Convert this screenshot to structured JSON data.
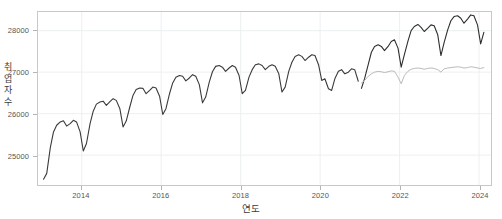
{
  "chart_data": {
    "type": "line",
    "title": "",
    "xlabel": "연도",
    "ylabel": "취업자수",
    "ylabel_chars": [
      "취",
      "업",
      "자",
      "수"
    ],
    "xlim": [
      2012.9,
      2024.3
    ],
    "ylim": [
      24280,
      28450
    ],
    "yticks": [
      25000,
      26000,
      27000,
      28000
    ],
    "ytick_labels": [
      "25000",
      "26000",
      "27000",
      "28000"
    ],
    "xticks": [
      2014,
      2016,
      2018,
      2020,
      2022,
      2024
    ],
    "xtick_labels": [
      "2014",
      "2016",
      "2018",
      "2020",
      "2022",
      "2024"
    ],
    "grid": true,
    "legend": "none",
    "series": [
      {
        "name": "취업자수-관측",
        "color": "#3a3a3a",
        "width": 1.1,
        "x": [
          2013.04,
          2013.12,
          2013.21,
          2013.29,
          2013.37,
          2013.46,
          2013.54,
          2013.62,
          2013.71,
          2013.79,
          2013.87,
          2013.96,
          2014.04,
          2014.12,
          2014.21,
          2014.29,
          2014.37,
          2014.46,
          2014.54,
          2014.62,
          2014.71,
          2014.79,
          2014.87,
          2014.96,
          2015.04,
          2015.12,
          2015.21,
          2015.29,
          2015.37,
          2015.46,
          2015.54,
          2015.62,
          2015.71,
          2015.79,
          2015.87,
          2015.96,
          2016.04,
          2016.12,
          2016.21,
          2016.29,
          2016.37,
          2016.46,
          2016.54,
          2016.62,
          2016.71,
          2016.79,
          2016.87,
          2016.96,
          2017.04,
          2017.12,
          2017.21,
          2017.29,
          2017.37,
          2017.46,
          2017.54,
          2017.62,
          2017.71,
          2017.79,
          2017.87,
          2017.96,
          2018.04,
          2018.12,
          2018.21,
          2018.29,
          2018.37,
          2018.46,
          2018.54,
          2018.62,
          2018.71,
          2018.79,
          2018.87,
          2018.96,
          2019.04,
          2019.12,
          2019.21,
          2019.29,
          2019.37,
          2019.46,
          2019.54,
          2019.62,
          2019.71,
          2019.79,
          2019.87,
          2019.96,
          2020.04,
          2020.12,
          2020.21,
          2020.29,
          2020.37,
          2020.46,
          2020.54,
          2020.62,
          2020.71,
          2020.79,
          2020.87,
          2020.96
        ],
        "values": [
          24420,
          24560,
          25180,
          25560,
          25720,
          25800,
          25830,
          25700,
          25760,
          25840,
          25800,
          25560,
          25100,
          25280,
          25760,
          26060,
          26230,
          26280,
          26300,
          26200,
          26290,
          26360,
          26320,
          26120,
          25680,
          25820,
          26160,
          26440,
          26580,
          26620,
          26610,
          26480,
          26560,
          26640,
          26620,
          26420,
          25980,
          26120,
          26480,
          26740,
          26880,
          26920,
          26900,
          26790,
          26860,
          26940,
          26900,
          26700,
          26260,
          26400,
          26760,
          27010,
          27140,
          27160,
          27120,
          27020,
          27100,
          27160,
          27120,
          26920,
          26480,
          26560,
          26880,
          27060,
          27180,
          27200,
          27160,
          27060,
          27140,
          27180,
          27140,
          26960,
          26520,
          26640,
          27020,
          27240,
          27380,
          27420,
          27380,
          27280,
          27360,
          27420,
          27400,
          27180,
          26800,
          26840,
          26600,
          26560,
          26840,
          27020,
          27060,
          26960,
          27000,
          27080,
          27060,
          26780
        ]
      },
      {
        "name": "취업자수-최근",
        "color": "#2e2e2e",
        "width": 1.1,
        "x": [
          2021.04,
          2021.12,
          2021.21,
          2021.29,
          2021.37,
          2021.46,
          2021.54,
          2021.62,
          2021.71,
          2021.79,
          2021.87,
          2021.96,
          2022.04,
          2022.12,
          2022.21,
          2022.29,
          2022.37,
          2022.46,
          2022.54,
          2022.62,
          2022.71,
          2022.79,
          2022.87,
          2022.96,
          2023.04,
          2023.12,
          2023.21,
          2023.29,
          2023.37,
          2023.46,
          2023.54,
          2023.62,
          2023.71,
          2023.79,
          2023.87,
          2023.96,
          2024.04,
          2024.12
        ],
        "values": [
          26610,
          26850,
          27180,
          27480,
          27620,
          27660,
          27620,
          27520,
          27620,
          27740,
          27780,
          27580,
          27120,
          27420,
          27750,
          28000,
          28100,
          28150,
          28080,
          27980,
          28060,
          28140,
          28120,
          27900,
          27400,
          27710,
          28020,
          28240,
          28340,
          28360,
          28300,
          28180,
          28280,
          28380,
          28360,
          28140,
          27680,
          27960
        ]
      },
      {
        "name": "계절조정",
        "color": "#b9b9b9",
        "width": 1.0,
        "x": [
          2021.04,
          2021.12,
          2021.21,
          2021.29,
          2021.37,
          2021.46,
          2021.54,
          2021.62,
          2021.71,
          2021.79,
          2021.87,
          2021.96,
          2022.04,
          2022.12,
          2022.21,
          2022.29,
          2022.37,
          2022.46,
          2022.54,
          2022.62,
          2022.71,
          2022.79,
          2022.87,
          2022.96,
          2023.04,
          2023.12,
          2023.21,
          2023.29,
          2023.37,
          2023.46,
          2023.54,
          2023.62,
          2023.71,
          2023.79,
          2023.87,
          2023.96,
          2024.04,
          2024.12
        ],
        "values": [
          26740,
          26800,
          26900,
          26960,
          27000,
          27020,
          27010,
          26990,
          27010,
          27030,
          27020,
          26880,
          26720,
          26920,
          27020,
          27070,
          27090,
          27100,
          27090,
          27070,
          27090,
          27100,
          27090,
          27060,
          27000,
          27080,
          27100,
          27110,
          27120,
          27130,
          27120,
          27100,
          27110,
          27130,
          27120,
          27100,
          27090,
          27110
        ]
      }
    ]
  }
}
